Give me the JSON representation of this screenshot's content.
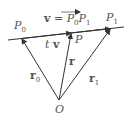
{
  "diagram": {
    "colors": {
      "line": "#333333",
      "text": "#555555"
    },
    "points": {
      "P0": {
        "name": "P",
        "sub": "0"
      },
      "P": {
        "name": "P"
      },
      "P1": {
        "name": "P",
        "sub": "1"
      },
      "O": {
        "name": "O"
      }
    },
    "vectors": {
      "r0": {
        "name": "r",
        "sub": "0"
      },
      "r": {
        "name": "r"
      },
      "r1": {
        "name": "r",
        "sub": "1"
      },
      "tv": {
        "scalar": "t",
        "vec": "v"
      }
    },
    "equation": {
      "lhs": "v",
      "eq": "=",
      "p": "P",
      "sub0": "0",
      "sub1": "1"
    }
  }
}
